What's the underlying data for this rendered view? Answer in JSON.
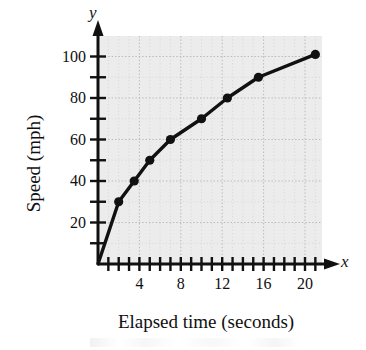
{
  "figure": {
    "axis_letters": {
      "x": "x",
      "y": "y"
    },
    "x_axis_title": "Elapsed time (seconds)",
    "y_axis_title": "Speed (mph)"
  },
  "chart_data": {
    "type": "line",
    "title": "",
    "subtitle": "",
    "xlabel": "Elapsed time (seconds)",
    "ylabel": "Speed (mph)",
    "x_axis_letter": "y",
    "axis_letter_x": "x",
    "axis_letter_y": "y",
    "xlim": [
      0,
      22
    ],
    "ylim": [
      0,
      110
    ],
    "x_tick_labels": [
      "4",
      "8",
      "12",
      "16",
      "20"
    ],
    "x_tick_values": [
      4,
      8,
      12,
      16,
      20
    ],
    "x_minor_tick_step": 1,
    "y_tick_labels": [
      "20",
      "40",
      "60",
      "80",
      "100"
    ],
    "y_tick_values": [
      20,
      40,
      60,
      80,
      100
    ],
    "y_minor_tick_step": 10,
    "grid": true,
    "grid_style": "dotted",
    "legend": "none",
    "marker": "filled-circle",
    "line_color": "#111111",
    "marker_color": "#111111",
    "plot_background": "#ececec",
    "series": [
      {
        "name": "Speed",
        "points": [
          {
            "x": 0,
            "y": 0
          },
          {
            "x": 2,
            "y": 30
          },
          {
            "x": 3.5,
            "y": 40
          },
          {
            "x": 5,
            "y": 50
          },
          {
            "x": 7,
            "y": 60
          },
          {
            "x": 10,
            "y": 70
          },
          {
            "x": 12.5,
            "y": 80
          },
          {
            "x": 15.5,
            "y": 90
          },
          {
            "x": 21,
            "y": 101
          }
        ],
        "x": [
          0,
          2,
          3.5,
          5,
          7,
          10,
          12.5,
          15.5,
          21
        ],
        "values": [
          0,
          30,
          40,
          50,
          60,
          70,
          80,
          90,
          101
        ]
      }
    ]
  }
}
